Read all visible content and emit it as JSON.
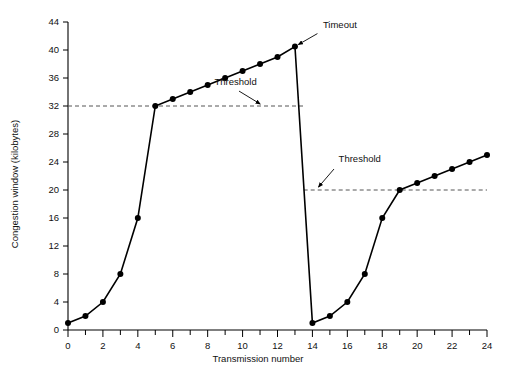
{
  "chart_data": {
    "type": "line",
    "title": "",
    "xlabel": "Transmission number",
    "ylabel": "Congestion window (kilobytes)",
    "xlim": [
      0,
      24
    ],
    "ylim": [
      0,
      44
    ],
    "xtick_step_major": 2,
    "xtick_step_minor": 1,
    "ytick_step": 4,
    "grid": false,
    "legend": "none",
    "x_tick_labels": [
      "0",
      "2",
      "4",
      "6",
      "8",
      "10",
      "12",
      "14",
      "16",
      "18",
      "20",
      "22",
      "24"
    ],
    "y_tick_labels": [
      "0",
      "4",
      "8",
      "12",
      "16",
      "20",
      "24",
      "28",
      "32",
      "36",
      "40",
      "44"
    ],
    "x": [
      0,
      1,
      2,
      3,
      4,
      5,
      6,
      7,
      8,
      9,
      10,
      11,
      12,
      13,
      14,
      15,
      16,
      17,
      18,
      19,
      20,
      21,
      22,
      23,
      24
    ],
    "values": [
      1,
      2,
      4,
      8,
      16,
      32,
      33,
      34,
      35,
      36,
      37,
      38,
      39,
      40.5,
      1,
      2,
      4,
      8,
      16,
      20,
      21,
      22,
      23,
      24,
      25
    ],
    "series": [
      {
        "name": "Congestion window",
        "values": [
          1,
          2,
          4,
          8,
          16,
          32,
          33,
          34,
          35,
          36,
          37,
          38,
          39,
          40.5,
          1,
          2,
          4,
          8,
          16,
          20,
          21,
          22,
          23,
          24,
          25
        ]
      }
    ],
    "annotations": [
      {
        "id": "timeout",
        "label": "Timeout",
        "x": 13,
        "y": 40.5,
        "label_x": 14.6,
        "label_y": 43.2
      },
      {
        "id": "threshold-1",
        "label": "Threshold",
        "x": 11.2,
        "y": 32,
        "label_x": 9.6,
        "label_y": 35.0
      },
      {
        "id": "threshold-2",
        "label": "Threshold",
        "x": 14.2,
        "y": 20,
        "label_x": 15.5,
        "label_y": 24.0
      }
    ],
    "threshold_lines": [
      {
        "id": "threshold-line-32",
        "value": 32,
        "x_start": 0,
        "x_end": 13.5
      },
      {
        "id": "threshold-line-20",
        "value": 20,
        "x_start": 13.5,
        "x_end": 24
      }
    ]
  }
}
